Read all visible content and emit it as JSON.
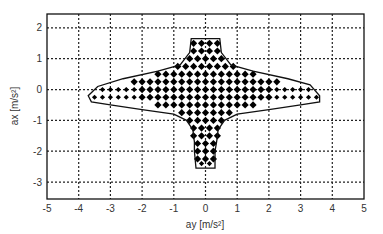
{
  "chart_data": {
    "type": "scatter",
    "title": "",
    "xlabel": "ay [m/s²]",
    "ylabel": "ax [m/s²]",
    "xlim": [
      -5,
      5
    ],
    "ylim": [
      -3.55,
      2.45
    ],
    "xticks": [
      -5,
      -4,
      -3,
      -2,
      -1,
      0,
      1,
      2,
      3,
      4,
      5
    ],
    "yticks": [
      2,
      1,
      0,
      -1,
      -2,
      -3
    ],
    "grid": true,
    "grid_style": "dotted",
    "legend": null,
    "marker": "diamond",
    "marker_color": "#000000",
    "grid_spacing": 0.25,
    "envelope": [
      [
        -0.45,
        1.65
      ],
      [
        0.45,
        1.65
      ],
      [
        0.5,
        1.2
      ],
      [
        0.8,
        0.8
      ],
      [
        1.5,
        0.6
      ],
      [
        2.6,
        0.35
      ],
      [
        3.3,
        0.15
      ],
      [
        3.6,
        -0.2
      ],
      [
        3.6,
        -0.4
      ],
      [
        3.0,
        -0.5
      ],
      [
        2.0,
        -0.65
      ],
      [
        1.0,
        -0.8
      ],
      [
        0.6,
        -1.0
      ],
      [
        0.4,
        -1.3
      ],
      [
        0.35,
        -1.7
      ],
      [
        0.3,
        -2.0
      ],
      [
        0.3,
        -2.55
      ],
      [
        -0.3,
        -2.55
      ],
      [
        -0.35,
        -2.0
      ],
      [
        -0.35,
        -1.7
      ],
      [
        -0.4,
        -1.3
      ],
      [
        -0.6,
        -1.0
      ],
      [
        -1.0,
        -0.8
      ],
      [
        -2.0,
        -0.65
      ],
      [
        -3.0,
        -0.5
      ],
      [
        -3.6,
        -0.4
      ],
      [
        -3.7,
        -0.2
      ],
      [
        -3.4,
        0.1
      ],
      [
        -2.6,
        0.35
      ],
      [
        -1.5,
        0.6
      ],
      [
        -0.8,
        0.8
      ],
      [
        -0.5,
        1.2
      ],
      [
        -0.45,
        1.65
      ]
    ],
    "rows": [
      {
        "ax": 1.5,
        "ay_range": [
          -0.375,
          0.375
        ],
        "density": "dense"
      },
      {
        "ax": 1.25,
        "ay_range": [
          -0.375,
          0.375
        ],
        "density": "dense"
      },
      {
        "ax": 1.0,
        "ay_range": [
          -0.5,
          0.5
        ],
        "density": "dense"
      },
      {
        "ax": 0.75,
        "ay_range": [
          -0.875,
          0.875
        ],
        "density": "dense"
      },
      {
        "ax": 0.5,
        "ay_range": [
          -1.5,
          1.5
        ],
        "density": "dense"
      },
      {
        "ax": 0.25,
        "ay_range": [
          -2.25,
          2.25
        ],
        "density": "dense"
      },
      {
        "ax": 0.0,
        "ay_range": [
          -3.25,
          3.25
        ],
        "density": "mixed"
      },
      {
        "ax": -0.25,
        "ay_range": [
          -3.5,
          3.5
        ],
        "density": "mixed"
      },
      {
        "ax": -0.5,
        "ay_range": [
          -1.5,
          1.5
        ],
        "density": "dense"
      },
      {
        "ax": -0.75,
        "ay_range": [
          -0.75,
          0.75
        ],
        "density": "dense"
      },
      {
        "ax": -1.0,
        "ay_range": [
          -0.5,
          0.5
        ],
        "density": "dense"
      },
      {
        "ax": -1.25,
        "ay_range": [
          -0.375,
          0.375
        ],
        "density": "dense"
      },
      {
        "ax": -1.5,
        "ay_range": [
          -0.375,
          0.375
        ],
        "density": "dense"
      },
      {
        "ax": -1.75,
        "ay_range": [
          -0.25,
          0.25
        ],
        "density": "dense"
      },
      {
        "ax": -2.0,
        "ay_range": [
          -0.25,
          0.25
        ],
        "density": "dense"
      },
      {
        "ax": -2.25,
        "ay_range": [
          -0.25,
          0.25
        ],
        "density": "dense"
      },
      {
        "ax": -2.4,
        "ay_range": [
          -0.125,
          0.125
        ],
        "density": "sparse"
      }
    ]
  }
}
